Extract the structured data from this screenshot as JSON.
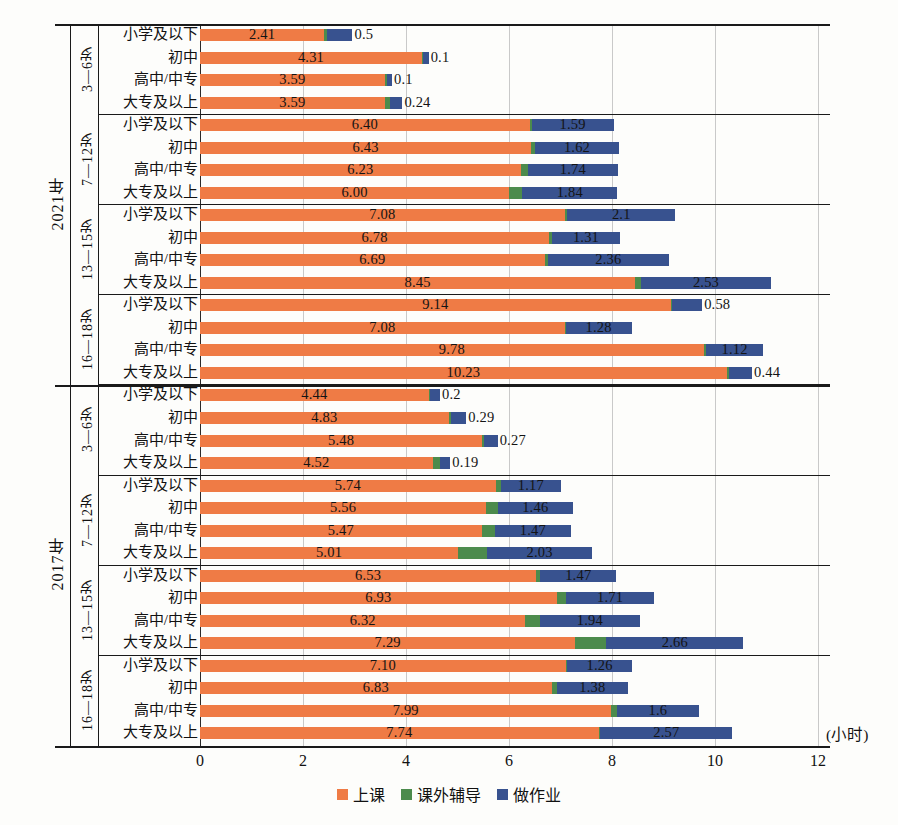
{
  "chart_data": {
    "type": "bar",
    "subtype": "stacked-horizontal",
    "title": "",
    "xlabel": "(小时)",
    "ylabel": "",
    "xlim": [
      0,
      12
    ],
    "xticks": [
      "0",
      "2",
      "4",
      "6",
      "8",
      "10",
      "12"
    ],
    "grid": true,
    "legend_position": "bottom",
    "series": [
      {
        "name": "上课",
        "color": "#EF7B45"
      },
      {
        "name": "课外辅导",
        "color": "#4C8B4C"
      },
      {
        "name": "做作业",
        "color": "#38528F"
      }
    ],
    "years": [
      {
        "year": "2021年",
        "age_groups": [
          {
            "age": "3—6岁",
            "rows": [
              {
                "edu": "小学及以下",
                "lesson": 2.41,
                "tutor": 0.05,
                "homework": 0.5,
                "lesson_label": "2.41",
                "homework_label": "0.5"
              },
              {
                "edu": "初中",
                "lesson": 4.31,
                "tutor": 0.03,
                "homework": 0.1,
                "lesson_label": "4.31",
                "homework_label": "0.1"
              },
              {
                "edu": "高中/中专",
                "lesson": 3.59,
                "tutor": 0.04,
                "homework": 0.1,
                "lesson_label": "3.59",
                "homework_label": "0.1"
              },
              {
                "edu": "大专及以上",
                "lesson": 3.59,
                "tutor": 0.1,
                "homework": 0.24,
                "lesson_label": "3.59",
                "homework_label": "0.24"
              }
            ]
          },
          {
            "age": "7—12岁",
            "rows": [
              {
                "edu": "小学及以下",
                "lesson": 6.4,
                "tutor": 0.04,
                "homework": 1.59,
                "lesson_label": "6.40",
                "homework_label": "1.59"
              },
              {
                "edu": "初中",
                "lesson": 6.43,
                "tutor": 0.08,
                "homework": 1.62,
                "lesson_label": "6.43",
                "homework_label": "1.62"
              },
              {
                "edu": "高中/中专",
                "lesson": 6.23,
                "tutor": 0.14,
                "homework": 1.74,
                "lesson_label": "6.23",
                "homework_label": "1.74"
              },
              {
                "edu": "大专及以上",
                "lesson": 6.0,
                "tutor": 0.26,
                "homework": 1.84,
                "lesson_label": "6.00",
                "homework_label": "1.84"
              }
            ]
          },
          {
            "age": "13—15岁",
            "rows": [
              {
                "edu": "小学及以下",
                "lesson": 7.08,
                "tutor": 0.05,
                "homework": 2.1,
                "lesson_label": "7.08",
                "homework_label": "2.1"
              },
              {
                "edu": "初中",
                "lesson": 6.78,
                "tutor": 0.06,
                "homework": 1.31,
                "lesson_label": "6.78",
                "homework_label": "1.31"
              },
              {
                "edu": "高中/中专",
                "lesson": 6.69,
                "tutor": 0.06,
                "homework": 2.36,
                "lesson_label": "6.69",
                "homework_label": "2.36"
              },
              {
                "edu": "大专及以上",
                "lesson": 8.45,
                "tutor": 0.11,
                "homework": 2.53,
                "lesson_label": "8.45",
                "homework_label": "2.53"
              }
            ]
          },
          {
            "age": "16—18岁",
            "rows": [
              {
                "edu": "小学及以下",
                "lesson": 9.14,
                "tutor": 0.03,
                "homework": 0.58,
                "lesson_label": "9.14",
                "homework_label": "0.58"
              },
              {
                "edu": "初中",
                "lesson": 7.08,
                "tutor": 0.02,
                "homework": 1.28,
                "lesson_label": "7.08",
                "homework_label": "1.28"
              },
              {
                "edu": "高中/中专",
                "lesson": 9.78,
                "tutor": 0.04,
                "homework": 1.12,
                "lesson_label": "9.78",
                "homework_label": "1.12"
              },
              {
                "edu": "大专及以上",
                "lesson": 10.23,
                "tutor": 0.05,
                "homework": 0.44,
                "lesson_label": "10.23",
                "homework_label": "0.44"
              }
            ]
          }
        ]
      },
      {
        "year": "2017年",
        "age_groups": [
          {
            "age": "3—6岁",
            "rows": [
              {
                "edu": "小学及以下",
                "lesson": 4.44,
                "tutor": 0.02,
                "homework": 0.2,
                "lesson_label": "4.44",
                "homework_label": "0.2"
              },
              {
                "edu": "初中",
                "lesson": 4.83,
                "tutor": 0.05,
                "homework": 0.29,
                "lesson_label": "4.83",
                "homework_label": "0.29"
              },
              {
                "edu": "高中/中专",
                "lesson": 5.48,
                "tutor": 0.03,
                "homework": 0.27,
                "lesson_label": "5.48",
                "homework_label": "0.27"
              },
              {
                "edu": "大专及以上",
                "lesson": 4.52,
                "tutor": 0.15,
                "homework": 0.19,
                "lesson_label": "4.52",
                "homework_label": "0.19"
              }
            ]
          },
          {
            "age": "7—12岁",
            "rows": [
              {
                "edu": "小学及以下",
                "lesson": 5.74,
                "tutor": 0.1,
                "homework": 1.17,
                "lesson_label": "5.74",
                "homework_label": "1.17"
              },
              {
                "edu": "初中",
                "lesson": 5.56,
                "tutor": 0.22,
                "homework": 1.46,
                "lesson_label": "5.56",
                "homework_label": "1.46"
              },
              {
                "edu": "高中/中专",
                "lesson": 5.47,
                "tutor": 0.26,
                "homework": 1.47,
                "lesson_label": "5.47",
                "homework_label": "1.47"
              },
              {
                "edu": "大专及以上",
                "lesson": 5.01,
                "tutor": 0.57,
                "homework": 2.03,
                "lesson_label": "5.01",
                "homework_label": "2.03"
              }
            ]
          },
          {
            "age": "13—15岁",
            "rows": [
              {
                "edu": "小学及以下",
                "lesson": 6.53,
                "tutor": 0.08,
                "homework": 1.47,
                "lesson_label": "6.53",
                "homework_label": "1.47"
              },
              {
                "edu": "初中",
                "lesson": 6.93,
                "tutor": 0.18,
                "homework": 1.71,
                "lesson_label": "6.93",
                "homework_label": "1.71"
              },
              {
                "edu": "高中/中专",
                "lesson": 6.32,
                "tutor": 0.28,
                "homework": 1.94,
                "lesson_label": "6.32",
                "homework_label": "1.94"
              },
              {
                "edu": "大专及以上",
                "lesson": 7.29,
                "tutor": 0.6,
                "homework": 2.66,
                "lesson_label": "7.29",
                "homework_label": "2.66"
              }
            ]
          },
          {
            "age": "16—18岁",
            "rows": [
              {
                "edu": "小学及以下",
                "lesson": 7.1,
                "tutor": 0.03,
                "homework": 1.26,
                "lesson_label": "7.10",
                "homework_label": "1.26"
              },
              {
                "edu": "初中",
                "lesson": 6.83,
                "tutor": 0.1,
                "homework": 1.38,
                "lesson_label": "6.83",
                "homework_label": "1.38"
              },
              {
                "edu": "高中/中专",
                "lesson": 7.99,
                "tutor": 0.1,
                "homework": 1.6,
                "lesson_label": "7.99",
                "homework_label": "1.6"
              },
              {
                "edu": "大专及以上",
                "lesson": 7.74,
                "tutor": 0.03,
                "homework": 2.57,
                "lesson_label": "7.74",
                "homework_label": "2.57"
              }
            ]
          }
        ]
      }
    ]
  }
}
